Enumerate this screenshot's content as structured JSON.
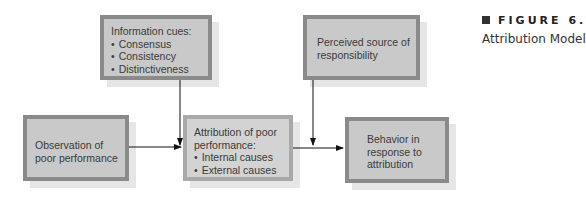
{
  "figure": {
    "number_label": "FIGURE 6.",
    "title": "Attribution Model"
  },
  "nodes": {
    "information_cues": {
      "title": "Information cues:",
      "items": [
        "Consensus",
        "Consistency",
        "Distinctiveness"
      ]
    },
    "perceived_source": {
      "text": "Perceived source of responsibility"
    },
    "observation": {
      "text": "Observation of poor performance"
    },
    "attribution": {
      "title": "Attribution of poor performance:",
      "items": [
        "Internal causes",
        "External causes"
      ]
    },
    "behavior": {
      "text": "Behavior in response to attribution"
    }
  },
  "edges": [
    {
      "from": "information_cues",
      "to": "attribution-input-line"
    },
    {
      "from": "observation",
      "to": "attribution"
    },
    {
      "from": "perceived_source",
      "to": "behavior-input-line"
    },
    {
      "from": "attribution",
      "to": "behavior"
    }
  ],
  "colors": {
    "box_fill": "#c9c9c9",
    "box_border_dark": "#8a8a8a",
    "box_border_light": "#a9a9a9",
    "shadow": "#e6e6e6",
    "arrow": "#111111"
  }
}
